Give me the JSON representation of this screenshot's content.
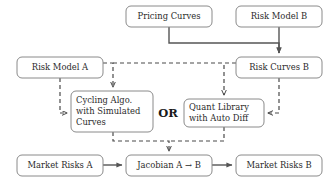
{
  "diagram": {
    "canvas": {
      "width": 333,
      "height": 182
    },
    "colors": {
      "background": "#ffffff",
      "box_stroke": "#8a8a8a",
      "box_fill": "#ffffff",
      "text": "#2b2b2b",
      "solid_edge": "#555555",
      "dashed_edge": "#4a4a4a"
    },
    "nodes": [
      {
        "id": "pricing-curves",
        "label": "Pricing Curves",
        "lines": [
          "Pricing Curves"
        ],
        "align": "center",
        "x": 126,
        "y": 6,
        "w": 86,
        "h": 21
      },
      {
        "id": "risk-model-b",
        "label": "Risk Model B",
        "lines": [
          "Risk Model B"
        ],
        "align": "center",
        "x": 236,
        "y": 6,
        "w": 86,
        "h": 21
      },
      {
        "id": "risk-model-a",
        "label": "Risk Model A",
        "lines": [
          "Risk Model A"
        ],
        "align": "center",
        "x": 17,
        "y": 57,
        "w": 86,
        "h": 21
      },
      {
        "id": "risk-curves-b",
        "label": "Risk Curves B",
        "lines": [
          "Risk Curves B"
        ],
        "align": "center",
        "x": 236,
        "y": 57,
        "w": 86,
        "h": 21
      },
      {
        "id": "cycling-algo",
        "label": "Cycling Algo. with Simulated Curves",
        "lines": [
          "Cycling Algo.",
          "with Simulated",
          "Curves"
        ],
        "align": "left",
        "x": 71,
        "y": 91,
        "w": 82,
        "h": 41
      },
      {
        "id": "quant-library",
        "label": "Quant Library with Auto Diff",
        "lines": [
          "Quant Library",
          "with Auto Diff"
        ],
        "align": "left",
        "x": 184,
        "y": 99,
        "w": 80,
        "h": 28
      },
      {
        "id": "market-risks-a",
        "label": "Market Risks A",
        "lines": [
          "Market Risks A"
        ],
        "align": "center",
        "x": 17,
        "y": 155,
        "w": 86,
        "h": 21
      },
      {
        "id": "jacobian",
        "label": "Jacobian A → B",
        "lines": [
          "Jacobian A → B"
        ],
        "align": "center",
        "x": 126,
        "y": 155,
        "w": 86,
        "h": 21
      },
      {
        "id": "market-risks-b",
        "label": "Market Risks B",
        "lines": [
          "Market Risks B"
        ],
        "align": "center",
        "x": 236,
        "y": 155,
        "w": 86,
        "h": 21
      }
    ],
    "or_label": {
      "id": "or-label",
      "text": "OR",
      "x": 168,
      "y": 117
    },
    "edges": [
      {
        "id": "pricing-to-riskcurvesb",
        "style": "solid",
        "from": "pricing-curves",
        "to": "risk-curves-b",
        "path": "M 169 27 L 169 43 L 279 43 L 279 53",
        "arrow": true
      },
      {
        "id": "riskmodelb-to-riskcurvesb",
        "style": "solid",
        "from": "risk-model-b",
        "to": "risk-curves-b",
        "path": "M 279 27 L 279 53",
        "arrow": true
      },
      {
        "id": "riskmodela-to-cycling",
        "style": "dashed",
        "from": "risk-model-a",
        "to": "cycling-algo",
        "path": "M 60 78 L 60 113 L 67 113",
        "arrow": true
      },
      {
        "id": "riskmodela-bus-to-cycling-top",
        "style": "dashed",
        "from": "risk-model-a",
        "to": "cycling-algo",
        "path": "M 103 63 L 113 63 L 113 87",
        "arrow": true
      },
      {
        "id": "riskcurvesb-bus-to-quant-top",
        "style": "dashed",
        "from": "risk-curves-b",
        "to": "quant-library",
        "path": "M 236 63 L 224 63 L 224 95",
        "arrow": true
      },
      {
        "id": "riskmodela-to-riskcurvesb-bus",
        "style": "dashed",
        "from": "risk-model-a",
        "to": "risk-curves-b",
        "path": "M 113 63 L 224 63",
        "arrow": false
      },
      {
        "id": "riskcurvesb-to-quant",
        "style": "dashed",
        "from": "risk-curves-b",
        "to": "quant-library",
        "path": "M 279 78 L 279 113 L 268 113",
        "arrow": true
      },
      {
        "id": "cycling-to-jacobian",
        "style": "dashed",
        "from": "cycling-algo",
        "to": "jacobian",
        "path": "M 113 132 L 113 141 L 169 141 L 169 151",
        "arrow": true
      },
      {
        "id": "quant-to-jacobian",
        "style": "dashed",
        "from": "quant-library",
        "to": "jacobian",
        "path": "M 224 127 L 224 141 L 169 141",
        "arrow": false
      },
      {
        "id": "marketrisksa-to-jacobian",
        "style": "solid",
        "from": "market-risks-a",
        "to": "jacobian",
        "path": "M 103 165 L 122 165",
        "arrow": true
      },
      {
        "id": "jacobian-to-marketrisksb",
        "style": "solid",
        "from": "jacobian",
        "to": "market-risks-b",
        "path": "M 212 165 L 232 165",
        "arrow": true
      }
    ]
  }
}
